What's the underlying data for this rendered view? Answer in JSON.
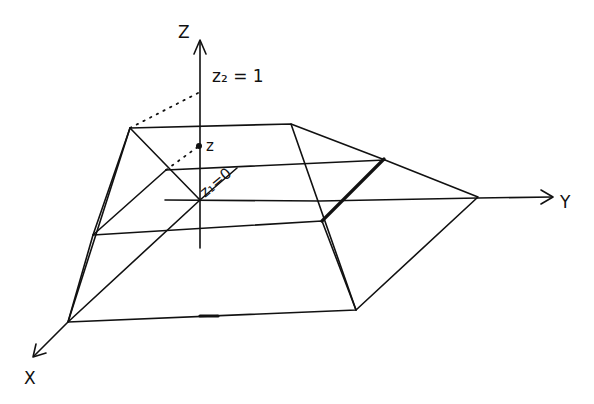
{
  "diagram": {
    "type": "hand-drawn 3D sketch",
    "axes": {
      "z": {
        "label": "Z"
      },
      "y": {
        "label": "Y"
      },
      "x": {
        "label": "X"
      }
    },
    "annotations": {
      "z2": "z₂ = 1",
      "z_point": "z",
      "z1": "z₁=0"
    },
    "colors": {
      "ink": "#111111",
      "background": "#ffffff"
    }
  }
}
